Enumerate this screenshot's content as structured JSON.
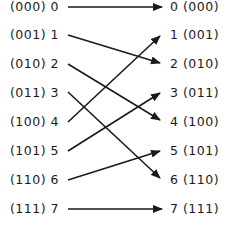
{
  "diagram": {
    "type": "perfect-shuffle-permutation",
    "left_nodes": [
      {
        "binary": "(000)",
        "index": "0"
      },
      {
        "binary": "(001)",
        "index": "1"
      },
      {
        "binary": "(010)",
        "index": "2"
      },
      {
        "binary": "(011)",
        "index": "3"
      },
      {
        "binary": "(100)",
        "index": "4"
      },
      {
        "binary": "(101)",
        "index": "5"
      },
      {
        "binary": "(110)",
        "index": "6"
      },
      {
        "binary": "(111)",
        "index": "7"
      }
    ],
    "right_nodes": [
      {
        "binary": "(000)",
        "index": "0"
      },
      {
        "binary": "(001)",
        "index": "1"
      },
      {
        "binary": "(010)",
        "index": "2"
      },
      {
        "binary": "(011)",
        "index": "3"
      },
      {
        "binary": "(100)",
        "index": "4"
      },
      {
        "binary": "(101)",
        "index": "5"
      },
      {
        "binary": "(110)",
        "index": "6"
      },
      {
        "binary": "(111)",
        "index": "7"
      }
    ],
    "edges": [
      {
        "from": 0,
        "to": 0
      },
      {
        "from": 1,
        "to": 2
      },
      {
        "from": 2,
        "to": 4
      },
      {
        "from": 3,
        "to": 6
      },
      {
        "from": 4,
        "to": 1
      },
      {
        "from": 5,
        "to": 3
      },
      {
        "from": 6,
        "to": 5
      },
      {
        "from": 7,
        "to": 7
      }
    ],
    "line_color": "#1a1a1a"
  },
  "labels": {
    "l0": "(000) 0",
    "l1": "(001) 1",
    "l2": "(010) 2",
    "l3": "(011) 3",
    "l4": "(100) 4",
    "l5": "(101) 5",
    "l6": "(110) 6",
    "l7": "(111) 7",
    "r0": "0 (000)",
    "r1": "1 (001)",
    "r2": "2 (010)",
    "r3": "3 (011)",
    "r4": "4 (100)",
    "r5": "5 (101)",
    "r6": "6 (110)",
    "r7": "7 (111)"
  }
}
